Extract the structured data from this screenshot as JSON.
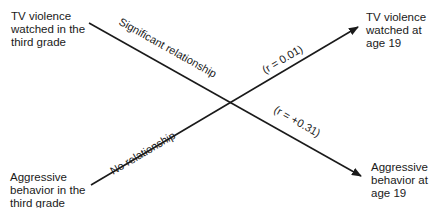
{
  "diagram": {
    "nodes": {
      "top_left": "TV violence\nwatched in the\nthird grade",
      "top_right": "TV violence\nwatched at\nage 19",
      "bottom_left": "Aggressive\nbehavior in the\nthird grade",
      "bottom_right": "Aggressive\nbehavior at\nage 19"
    },
    "edges": [
      {
        "from": "top_left",
        "to": "bottom_right",
        "label": "Significant relationship",
        "coefficient": "(r = +0.31)"
      },
      {
        "from": "bottom_left",
        "to": "top_right",
        "label": "No relationship",
        "coefficient": "(r = 0.01)"
      }
    ],
    "line_color": "#1a1a1a"
  }
}
